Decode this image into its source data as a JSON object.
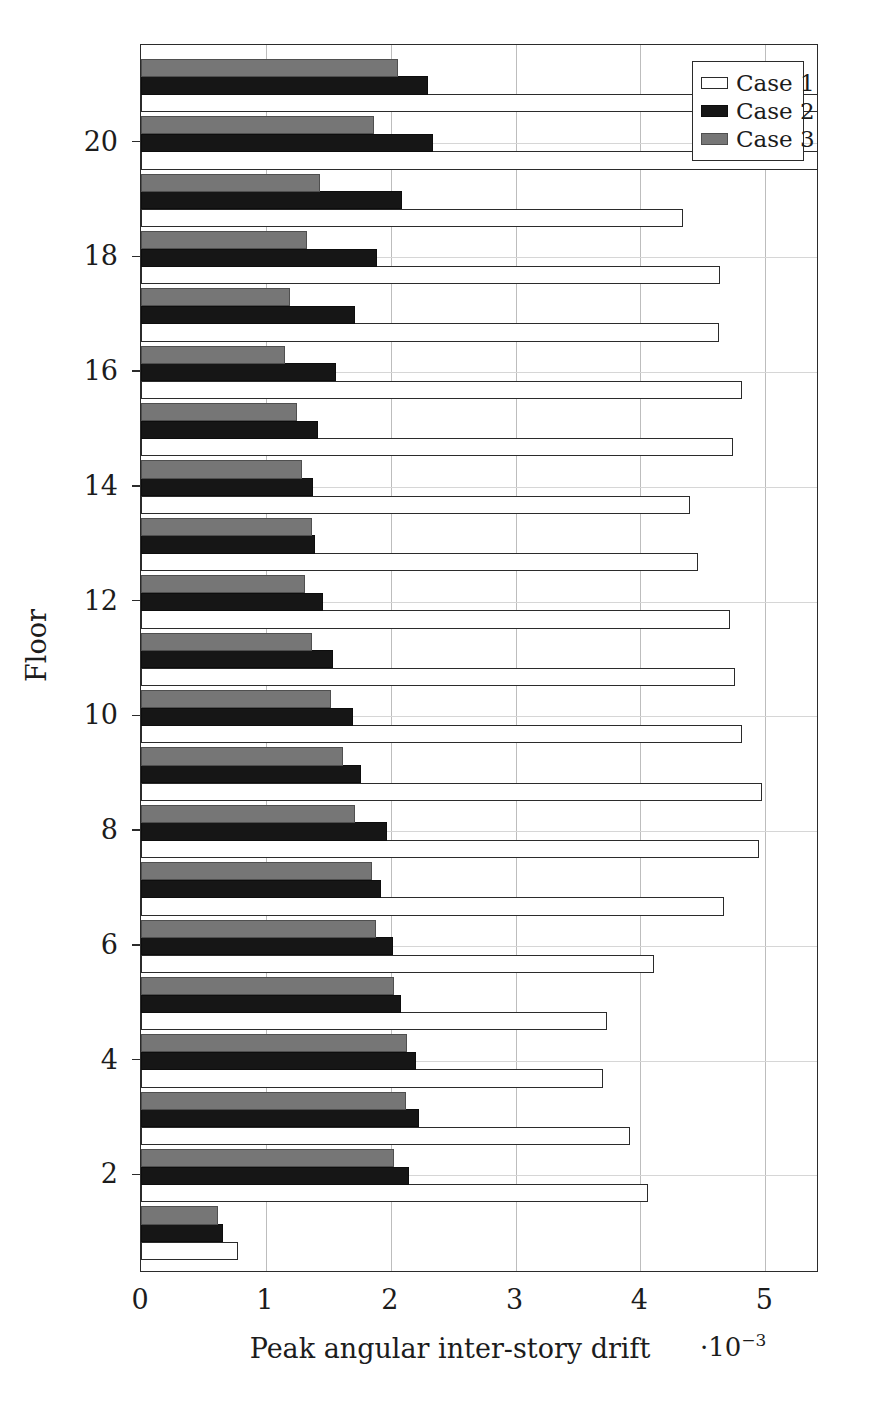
{
  "chart_data": {
    "type": "bar",
    "orientation": "horizontal",
    "title": "",
    "xlabel": "Peak angular inter-story drift",
    "ylabel": "Floor",
    "x_multiplier": "·10",
    "x_multiplier_exponent": "−3",
    "xlim": [
      0,
      5.43
    ],
    "ylim": [
      0.3,
      21.7
    ],
    "xticks": [
      0,
      1,
      2,
      3,
      4,
      5
    ],
    "xtick_labels": [
      "0",
      "1",
      "2",
      "3",
      "4",
      "5"
    ],
    "yticks": [
      2,
      4,
      6,
      8,
      10,
      12,
      14,
      16,
      18,
      20
    ],
    "ytick_labels": [
      "2",
      "4",
      "6",
      "8",
      "10",
      "12",
      "14",
      "16",
      "18",
      "20"
    ],
    "grid": true,
    "legend_position": "upper right",
    "categories": [
      1,
      2,
      3,
      4,
      5,
      6,
      7,
      8,
      9,
      10,
      11,
      12,
      13,
      14,
      15,
      16,
      17,
      18,
      19,
      20,
      21
    ],
    "series": [
      {
        "name": "Case 1",
        "color": "#ffffff",
        "edge_color": "#2b2b2b",
        "values": [
          0.78,
          4.06,
          3.92,
          3.7,
          3.73,
          4.11,
          4.67,
          4.95,
          4.97,
          4.81,
          4.76,
          4.72,
          4.46,
          4.4,
          4.74,
          4.81,
          4.63,
          4.64,
          4.34,
          5.43,
          5.43
        ]
      },
      {
        "name": "Case 2",
        "color": "#161616",
        "edge_color": "#0d0d0d",
        "values": [
          0.66,
          2.15,
          2.23,
          2.2,
          2.08,
          2.02,
          1.92,
          1.97,
          1.76,
          1.7,
          1.54,
          1.46,
          1.39,
          1.38,
          1.42,
          1.56,
          1.71,
          1.89,
          2.09,
          2.34,
          2.3
        ]
      },
      {
        "name": "Case 3",
        "color": "#767676",
        "edge_color": "#4f4f4f",
        "values": [
          0.62,
          2.03,
          2.12,
          2.13,
          2.03,
          1.88,
          1.85,
          1.71,
          1.62,
          1.52,
          1.37,
          1.31,
          1.37,
          1.29,
          1.25,
          1.15,
          1.19,
          1.33,
          1.43,
          1.87,
          2.06
        ]
      }
    ]
  },
  "legend": {
    "items": [
      {
        "label": "Case 1"
      },
      {
        "label": "Case 2"
      },
      {
        "label": "Case 3"
      }
    ]
  }
}
